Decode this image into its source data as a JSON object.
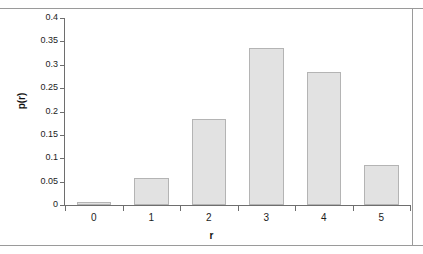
{
  "chart_data": {
    "type": "bar",
    "title": "",
    "xlabel": "r",
    "ylabel": "p(r)",
    "categories": [
      "0",
      "1",
      "2",
      "3",
      "4",
      "5"
    ],
    "values": [
      0.007,
      0.057,
      0.185,
      0.335,
      0.285,
      0.085
    ],
    "ylim": [
      0,
      0.4
    ],
    "ytick_labels": [
      "0",
      "0.05",
      "0.1",
      "0.15",
      "0.2",
      "0.25",
      "0.3",
      "0.35",
      "0.4"
    ],
    "ytick_values": [
      0,
      0.05,
      0.1,
      0.15,
      0.2,
      0.25,
      0.3,
      0.35,
      0.4
    ],
    "grid": false,
    "legend": "none",
    "series": [
      {
        "name": "p(r)",
        "values": [
          0.007,
          0.057,
          0.185,
          0.335,
          0.285,
          0.085
        ]
      }
    ],
    "colors": {
      "bar_fill": "#e2e2e2",
      "bar_border": "#b4b4b4",
      "axis": "#6e6e6e",
      "text": "#1c1c1c",
      "frame": "#9a9a9a"
    }
  }
}
